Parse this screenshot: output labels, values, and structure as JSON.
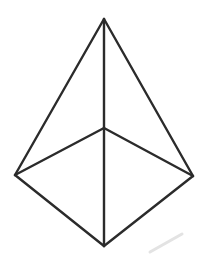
{
  "figure": {
    "name": "wireframe-pyramid-line-drawing",
    "background_color": "#ffffff",
    "stroke_color": "#2b2b2b",
    "stroke_width": 2.4,
    "canvas": {
      "width": 200,
      "height": 260
    },
    "vertices": [
      {
        "id": "apex",
        "label": "apex",
        "x": 104,
        "y": 19
      },
      {
        "id": "left",
        "label": "left base corner",
        "x": 15,
        "y": 175
      },
      {
        "id": "right",
        "label": "right base corner",
        "x": 193,
        "y": 176
      },
      {
        "id": "bottom",
        "label": "front base corner",
        "x": 104,
        "y": 246
      },
      {
        "id": "center",
        "label": "back base corner",
        "x": 104,
        "y": 128
      }
    ],
    "edges": [
      {
        "id": "apex-left",
        "from": "apex",
        "to": "left",
        "style": "solid"
      },
      {
        "id": "apex-right",
        "from": "apex",
        "to": "right",
        "style": "solid"
      },
      {
        "id": "apex-center",
        "from": "apex",
        "to": "center",
        "style": "solid"
      },
      {
        "id": "center-left",
        "from": "center",
        "to": "left",
        "style": "solid"
      },
      {
        "id": "center-right",
        "from": "center",
        "to": "right",
        "style": "solid"
      },
      {
        "id": "center-bottom",
        "from": "center",
        "to": "bottom",
        "style": "solid"
      },
      {
        "id": "left-bottom",
        "from": "left",
        "to": "bottom",
        "style": "solid"
      },
      {
        "id": "right-bottom",
        "from": "right",
        "to": "bottom",
        "style": "solid"
      }
    ],
    "smudge": {
      "id": "pencil-smudge",
      "color": "#e3e3e3",
      "x1": 150,
      "y1": 252,
      "x2": 182,
      "y2": 234
    }
  }
}
